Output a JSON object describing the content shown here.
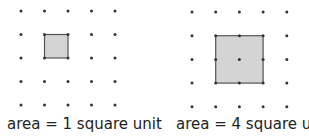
{
  "figures": [
    {
      "name": "unit-square",
      "caption": "area = 1 square unit",
      "grid": {
        "cols": 5,
        "rows": 5,
        "origin": [
          21,
          11
        ],
        "spacing": 23.5
      },
      "square": {
        "col": 1,
        "row": 1,
        "size": 1
      }
    },
    {
      "name": "two-by-two-square",
      "caption": "area = 4 square units",
      "grid": {
        "cols": 5,
        "rows": 5,
        "origin": [
          192,
          12
        ],
        "spacing": 23.7
      },
      "square": {
        "col": 1,
        "row": 1,
        "size": 2
      }
    }
  ],
  "colors": {
    "dot": "#333333",
    "fill": "#d4d4d4",
    "stroke": "#555555",
    "text": "#222222"
  }
}
